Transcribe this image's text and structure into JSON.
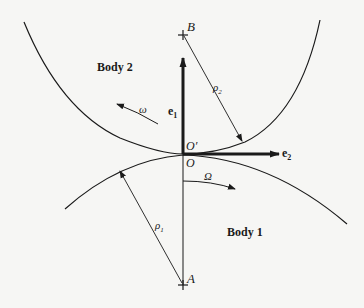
{
  "diagram": {
    "type": "contact-geometry",
    "colors": {
      "background": "#f6f6f4",
      "ink": "#1a1a1a"
    },
    "bodies": [
      {
        "id": "body2",
        "label": "Body 2",
        "center_label": "B",
        "radius_label": "ρ2",
        "rotation_label": "ω"
      },
      {
        "id": "body1",
        "label": "Body 1",
        "center_label": "A",
        "radius_label": "ρ1",
        "rotation_label": "Ω"
      }
    ],
    "points": {
      "contact_upper": "O′",
      "contact_lower": "O"
    },
    "basis_vectors": {
      "e1": "e",
      "e1_sub": "1",
      "e2": "e",
      "e2_sub": "2"
    },
    "radius_labels": {
      "rho2_base": "ρ",
      "rho2_sub": "2",
      "rho1_base": "ρ",
      "rho1_sub": "1"
    }
  }
}
